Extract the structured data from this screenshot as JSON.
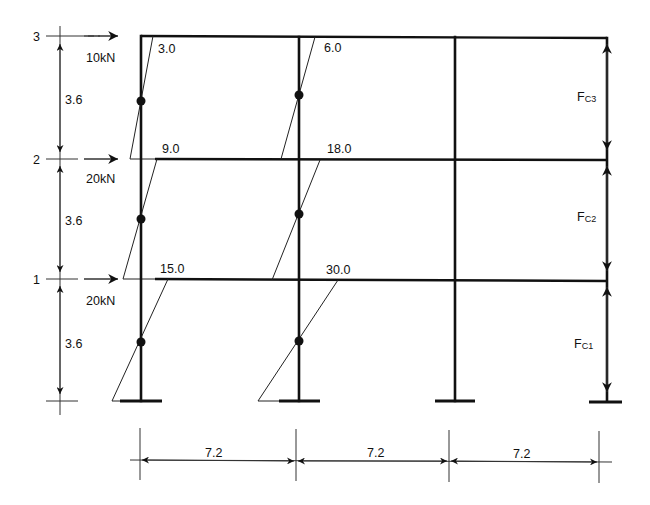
{
  "diagram": {
    "type": "portal-frame-moment-diagram",
    "stories": [
      {
        "level_label": "1",
        "height": "3.6",
        "load": "20kN"
      },
      {
        "level_label": "2",
        "height": "3.6",
        "load": "20kN"
      },
      {
        "level_label": "3",
        "height": "3.6",
        "load": "10kN"
      }
    ],
    "bays": [
      {
        "span": "7.2"
      },
      {
        "span": "7.2"
      },
      {
        "span": "7.2"
      }
    ],
    "column_A_moments": {
      "story3": "3.0",
      "story2": "9.0",
      "story1": "15.0"
    },
    "column_B_moments": {
      "story3": "6.0",
      "story2": "18.0",
      "story1": "30.0"
    },
    "column_forces": {
      "story3": {
        "main": "F",
        "subscript": "C3"
      },
      "story2": {
        "main": "F",
        "subscript": "C2"
      },
      "story1": {
        "main": "F",
        "subscript": "C1"
      }
    }
  }
}
